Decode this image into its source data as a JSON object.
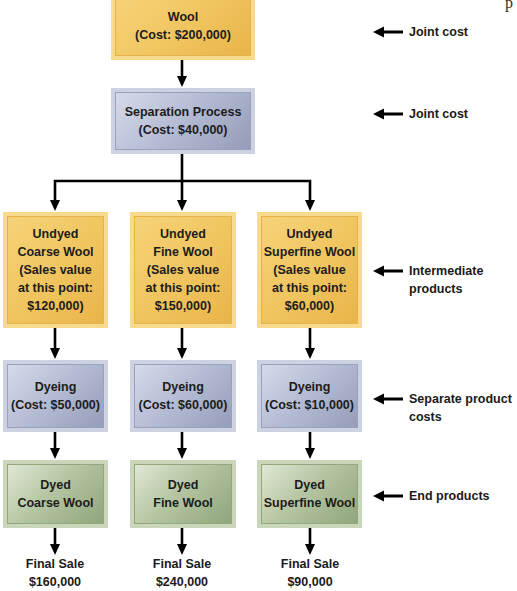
{
  "diagram": {
    "type": "joint cost flowchart",
    "corner_fragment": "p",
    "joint_stage": {
      "raw_material": {
        "title": "Wool",
        "detail": "(Cost: $200,000)",
        "color": "#f1c763"
      },
      "process": {
        "title": "Separation Process",
        "detail": "(Cost: $40,000)",
        "color": "#b3bad3"
      }
    },
    "intermediate_products": [
      {
        "line1": "Undyed",
        "line2": "Coarse Wool",
        "line3": "(Sales value",
        "line4": "at this point:",
        "line5": "$120,000)"
      },
      {
        "line1": "Undyed",
        "line2": "Fine Wool",
        "line3": "(Sales value",
        "line4": "at this point:",
        "line5": "$150,000)"
      },
      {
        "line1": "Undyed",
        "line2": "Superfine Wool",
        "line3": "(Sales value",
        "line4": "at this point:",
        "line5": "$60,000)"
      }
    ],
    "separate_processes": [
      {
        "title": "Dyeing",
        "detail": "(Cost: $50,000)"
      },
      {
        "title": "Dyeing",
        "detail": "(Cost: $60,000)"
      },
      {
        "title": "Dyeing",
        "detail": "(Cost: $10,000)"
      }
    ],
    "end_products": [
      {
        "line1": "Dyed",
        "line2": "Coarse Wool"
      },
      {
        "line1": "Dyed",
        "line2": "Fine Wool"
      },
      {
        "line1": "Dyed",
        "line2": "Superfine Wool"
      }
    ],
    "final_sales": [
      {
        "label": "Final Sale",
        "value": "$160,000"
      },
      {
        "label": "Final Sale",
        "value": "$240,000"
      },
      {
        "label": "Final Sale",
        "value": "$90,000"
      }
    ],
    "side_annotations": [
      {
        "line1": "Joint cost",
        "line2": ""
      },
      {
        "line1": "Joint cost",
        "line2": ""
      },
      {
        "line1": "Intermediate",
        "line2": "products"
      },
      {
        "line1": "Separate product",
        "line2": "costs"
      },
      {
        "line1": "End products",
        "line2": ""
      }
    ],
    "colors": {
      "joint_and_intermediate": "#f1c763",
      "processing": "#b3bad3",
      "end_product": "#b6c6a3",
      "arrows": "#000000"
    }
  }
}
